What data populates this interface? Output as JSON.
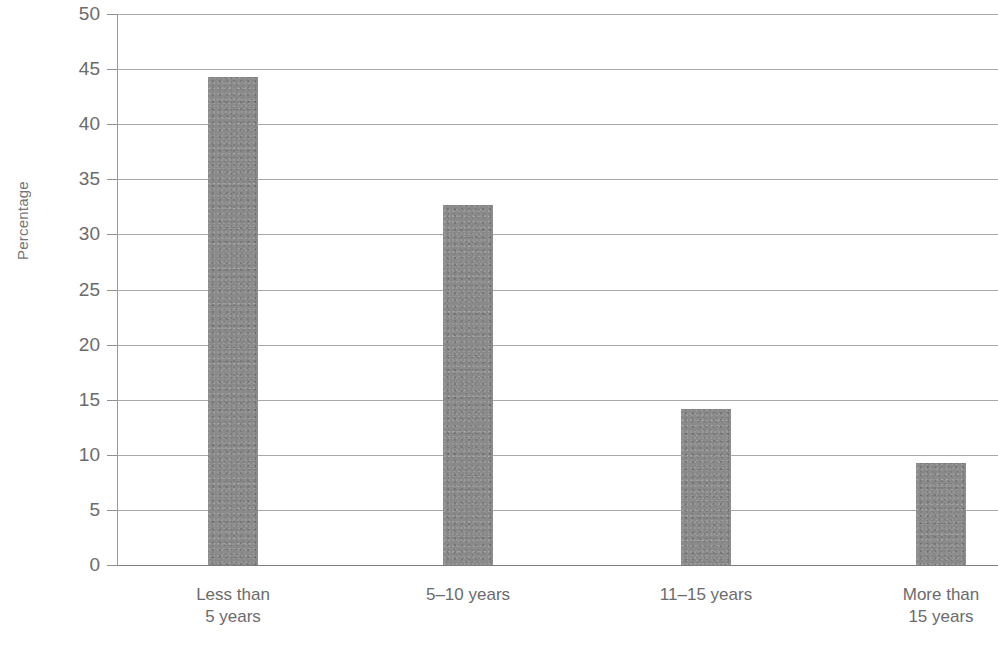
{
  "chart_data": {
    "type": "bar",
    "title": "",
    "subtitle": "",
    "xlabel": "",
    "ylabel": "Percentage",
    "categories": [
      "Less than\n5 years",
      "5–10 years",
      "11–15 years",
      "More than\n15 years"
    ],
    "values": [
      44.3,
      32.7,
      14.2,
      9.3
    ],
    "ylim": [
      0,
      50
    ],
    "ytick_values": [
      0,
      5,
      10,
      15,
      20,
      25,
      30,
      35,
      40,
      45,
      50
    ],
    "ytick_labels": [
      "0",
      "5",
      "10",
      "15",
      "20",
      "25",
      "30",
      "35",
      "40",
      "45",
      "50"
    ],
    "grid": true,
    "legend": false,
    "legend_position": "none",
    "bar_color": "#8a8a8a",
    "grid_color": "#9a9a9a",
    "text_color": "#6b6b6b"
  },
  "axes": {
    "y_title": "Percentage"
  }
}
